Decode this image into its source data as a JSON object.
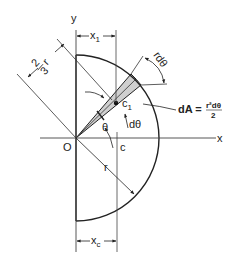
{
  "figure": {
    "colors": {
      "line": "#222222",
      "axis": "#444444",
      "wedge_fill": "#cfcfcf",
      "background": "#ffffff"
    }
  },
  "labels": {
    "y_axis": "y",
    "x_axis": "x",
    "origin": "O",
    "centroid_element": "c",
    "centroid_element_sub": "1",
    "centroid_area": "c",
    "radius": "r",
    "theta": "θ",
    "d_theta": "dθ",
    "r_d_theta": "rdθ",
    "x1": "x",
    "x1_sub": "1",
    "xc": "x",
    "xc_sub": "c",
    "two_thirds_num": "2",
    "two_thirds_den": "3",
    "two_thirds_r": "r",
    "dA_lhs": "dA =",
    "dA_num": "r²dθ",
    "dA_den": "2"
  }
}
